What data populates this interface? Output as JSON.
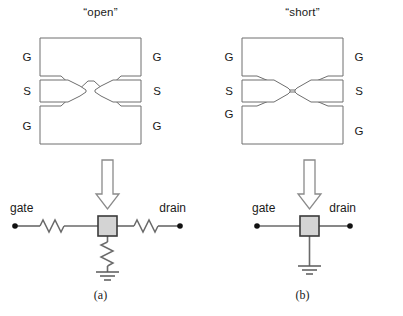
{
  "figure": {
    "name": "gsg-probe-pad-open-short-figure",
    "panels": [
      {
        "id": "a",
        "title": "“open”",
        "caption": "(a)",
        "pad_layout": {
          "kind": "gsg-probe-pads",
          "state": "open",
          "tips_touching": false,
          "labels": {
            "top_left": "G",
            "top_right": "G",
            "mid_left": "S",
            "mid_right": "S",
            "bottom_left": "G",
            "bottom_right": "G"
          }
        },
        "circuit": {
          "arrow_icon": "down-arrow-icon",
          "left_terminal": "gate",
          "right_terminal": "drain",
          "dut_element": "dut-box",
          "resistor_left": true,
          "resistor_right": true,
          "resistor_shunt": true,
          "ground": true
        }
      },
      {
        "id": "b",
        "title": "“short”",
        "caption": "(b)",
        "pad_layout": {
          "kind": "gsg-probe-pads",
          "state": "short",
          "tips_touching": true,
          "labels": {
            "top_left": "G",
            "top_right": "G",
            "mid_left": "S",
            "mid_right": "S",
            "bottom_left": "G",
            "bottom_right": "G"
          }
        },
        "circuit": {
          "arrow_icon": "down-arrow-icon",
          "left_terminal": "gate",
          "right_terminal": "drain",
          "dut_element": "dut-box",
          "resistor_left": false,
          "resistor_right": false,
          "resistor_shunt": false,
          "ground": true
        }
      }
    ]
  },
  "colors": {
    "pad_stroke": "#6e6e6e",
    "wire": "#6a6a6a",
    "dut_fill": "#d4d4d4",
    "dut_stroke": "#3a3a3a",
    "text": "#1a1a1a",
    "background": "#ffffff"
  }
}
